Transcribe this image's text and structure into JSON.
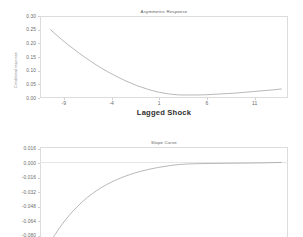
{
  "figure": {
    "background_color": "#ffffff",
    "line_color": "#9a9a9a",
    "axis_color": "#dcdcdc",
    "text_color": "#6b6b6b"
  },
  "chart_data": [
    {
      "type": "line",
      "panel_name": "asymmetric-response-panel",
      "title": "Asymmetric Response",
      "xlabel": "Lagged Shock",
      "ylabel": "Conditional response",
      "xlim": [
        -11.5,
        14.5
      ],
      "ylim": [
        0.0,
        0.3
      ],
      "xticks": [
        -9,
        -4,
        1,
        6,
        11
      ],
      "xticklabels": [
        "-9",
        "-4",
        "1",
        "6",
        "11"
      ],
      "yticks": [
        0.0,
        0.05,
        0.1,
        0.15,
        0.2,
        0.25,
        0.3
      ],
      "yticklabels": [
        "0.00",
        "0.05",
        "0.10",
        "0.15",
        "0.20",
        "0.25",
        "0.30"
      ],
      "grid": false,
      "legend": null,
      "series": [
        {
          "name": "conditional response",
          "x": [
            -10.4,
            -9.8,
            -9.2,
            -8.6,
            -8.0,
            -7.4,
            -6.8,
            -6.2,
            -5.6,
            -5.0,
            -4.4,
            -3.8,
            -3.2,
            -2.6,
            -2.0,
            -1.4,
            -0.8,
            -0.2,
            0.4,
            1.0,
            1.6,
            2.2,
            2.8,
            3.4,
            4.0,
            5.0,
            6.0,
            7.0,
            8.0,
            9.0,
            10.0,
            11.0,
            12.0,
            13.0,
            13.8
          ],
          "y": [
            0.25,
            0.231,
            0.213,
            0.196,
            0.18,
            0.164,
            0.149,
            0.135,
            0.121,
            0.108,
            0.096,
            0.085,
            0.074,
            0.064,
            0.055,
            0.046,
            0.039,
            0.032,
            0.026,
            0.021,
            0.017,
            0.014,
            0.012,
            0.011,
            0.011,
            0.011,
            0.012,
            0.014,
            0.016,
            0.018,
            0.021,
            0.024,
            0.027,
            0.03,
            0.033
          ]
        }
      ]
    },
    {
      "type": "line",
      "panel_name": "slope-curve-panel",
      "title": "Slope Curve",
      "xlabel": "",
      "ylabel": "",
      "xlim": [
        -11.5,
        14.5
      ],
      "ylim": [
        -0.088,
        0.018
      ],
      "xticks": [],
      "xticklabels": [],
      "yticks": [
        0.016,
        0.0,
        -0.016,
        -0.032,
        -0.048,
        -0.064,
        -0.08
      ],
      "yticklabels": [
        "0.016",
        "0.000",
        "-0.016",
        "-0.032",
        "-0.048",
        "-0.064",
        "-0.080"
      ],
      "grid": false,
      "zero_reference_line": 0.0,
      "legend": null,
      "series": [
        {
          "name": "slope",
          "x": [
            -10.4,
            -10.0,
            -9.5,
            -9.0,
            -8.5,
            -8.0,
            -7.5,
            -7.0,
            -6.5,
            -6.0,
            -5.5,
            -5.0,
            -4.5,
            -4.0,
            -3.5,
            -3.0,
            -2.5,
            -2.0,
            -1.5,
            -1.0,
            -0.5,
            0.0,
            0.5,
            1.0,
            1.6,
            2.2,
            3.0,
            4.0,
            5.0,
            6.5,
            8.0,
            10.0,
            12.0,
            13.8
          ],
          "y": [
            -0.086,
            -0.08,
            -0.072,
            -0.0648,
            -0.0582,
            -0.0522,
            -0.0468,
            -0.0419,
            -0.0374,
            -0.0334,
            -0.0297,
            -0.0264,
            -0.0234,
            -0.0207,
            -0.0182,
            -0.016,
            -0.014,
            -0.0122,
            -0.0105,
            -0.009,
            -0.0077,
            -0.0065,
            -0.0054,
            -0.0044,
            -0.0034,
            -0.0024,
            -0.0014,
            -0.0007,
            -0.0004,
            -0.0002,
            0.0,
            0.0002,
            0.0005,
            0.001
          ]
        }
      ]
    }
  ]
}
